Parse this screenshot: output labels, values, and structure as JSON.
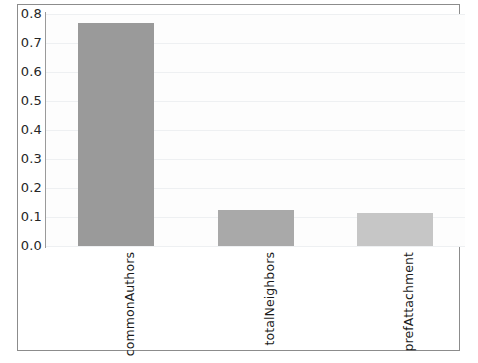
{
  "chart_data": {
    "type": "bar",
    "title": "",
    "subtitle": "",
    "xlabel": "",
    "ylabel": "",
    "categories": [
      "commonAuthors",
      "totalNeighbors",
      "prefAttachment"
    ],
    "values": [
      0.77,
      0.125,
      0.115
    ],
    "series": [
      {
        "name": "feature importance",
        "values": [
          0.77,
          0.125,
          0.115
        ]
      }
    ],
    "ylim": [
      0.0,
      0.8
    ],
    "ytick_labels": [
      "0.8",
      "0.7",
      "0.6",
      "0.5",
      "0.4",
      "0.3",
      "0.2",
      "0.1",
      "0.0"
    ],
    "ytick_values": [
      0.8,
      0.7,
      0.6,
      0.5,
      0.4,
      0.3,
      0.2,
      0.1,
      0.0
    ],
    "grid": true,
    "grid_axis": "y",
    "legend": false,
    "legend_position": "none",
    "bar_colors": [
      "#9a9a9a",
      "#a9a9a9",
      "#c6c6c6"
    ],
    "xtick_rotation": -90,
    "annotations": []
  },
  "colors": {
    "frame_border": "#8c8c8c",
    "axis_line": "#9a9a9a",
    "gridline": "#eef0f2",
    "plot_background": "#fdfdfd",
    "page_background": "#ffffff",
    "tick_text": "#262626"
  }
}
